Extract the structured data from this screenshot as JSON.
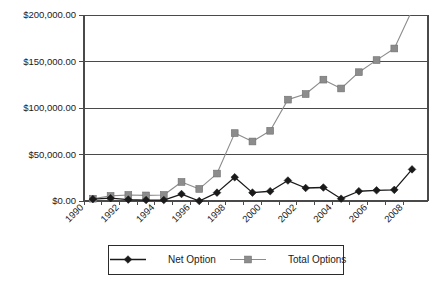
{
  "chart_data": {
    "type": "line",
    "title": "",
    "subtitle": "",
    "xlabel": "",
    "ylabel": "",
    "grid": true,
    "legend_position": "bottom",
    "x": [
      1990,
      1991,
      1992,
      1993,
      1994,
      1995,
      1996,
      1997,
      1998,
      1999,
      2000,
      2001,
      2002,
      2003,
      2004,
      2005,
      2006,
      2007,
      2008
    ],
    "xtick_labels": [
      "1990",
      "1992",
      "1994",
      "1996",
      "1998",
      "2000",
      "2002",
      "2004",
      "2006",
      "2008"
    ],
    "xticks": [
      1990,
      1992,
      1994,
      1996,
      1998,
      2000,
      2002,
      2004,
      2006,
      2008
    ],
    "xlim": [
      1989.5,
      2008.9
    ],
    "ylim": [
      0,
      200000
    ],
    "yticks": [
      0,
      50000,
      100000,
      150000,
      200000
    ],
    "ytick_labels": [
      "$0.00",
      "$50,000.00",
      "$100,000.00",
      "$150,000.00",
      "$200,000.00"
    ],
    "series": [
      {
        "name": "Net Option",
        "color": "#1a1a1a",
        "marker": "diamond",
        "values": [
          2000,
          3000,
          1500,
          1000,
          1000,
          7500,
          0,
          9000,
          25500,
          9000,
          10500,
          22000,
          14000,
          14500,
          2500,
          10500,
          11500,
          12000,
          34000
        ]
      },
      {
        "name": "Total Options",
        "color": "#8c8c8c",
        "marker": "square",
        "values": [
          2500,
          5500,
          6500,
          6000,
          6500,
          20500,
          13000,
          29500,
          73000,
          64000,
          75500,
          109000,
          115000,
          130500,
          121000,
          138500,
          151500,
          164000,
          205000
        ]
      }
    ]
  },
  "legend": {
    "entries": [
      {
        "label": "Net Option"
      },
      {
        "label": "Total Options"
      }
    ]
  },
  "colors": {
    "net_option": "#1a1a1a",
    "total_options": "#8c8c8c",
    "axis": "#4a4a4a",
    "background": "#ffffff"
  }
}
